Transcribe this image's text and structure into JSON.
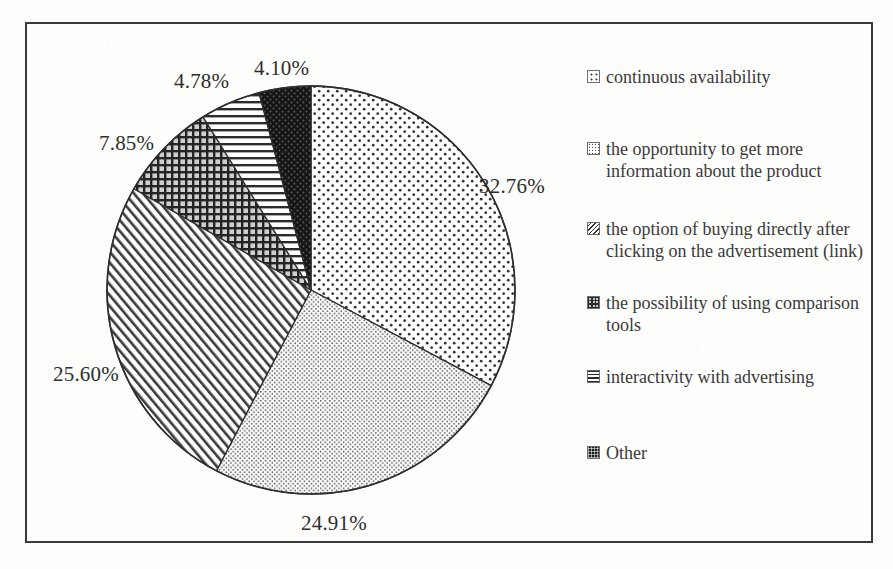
{
  "chart_data": {
    "type": "pie",
    "title": "",
    "xlabel": "",
    "ylabel": "",
    "legend_position": "right",
    "grid": false,
    "start_angle_deg": 0,
    "direction": "clockwise",
    "categories": [
      "continuous availability",
      "the opportunity to get more information about the product",
      "the option of buying directly after clicking on the advertisement (link)",
      "the possibility of using comparison tools",
      "interactivity with advertising",
      "Other"
    ],
    "values": [
      32.76,
      24.91,
      25.6,
      7.85,
      4.78,
      4.1
    ],
    "data_labels": [
      "32.76%",
      "24.91%",
      "25.60%",
      "7.85%",
      "4.78%",
      "4.10%"
    ],
    "slice_patterns": [
      "dots-sparse",
      "dots-dense",
      "diagonal-hatch",
      "checkered",
      "horizontal-lines",
      "solid-black"
    ]
  },
  "legend": {
    "items": [
      {
        "label": "continuous availability",
        "pattern": "dots-sparse"
      },
      {
        "label": "the opportunity to get more information about the product",
        "pattern": "dots-dense"
      },
      {
        "label": "the option of buying directly after clicking on the advertisement (link)",
        "pattern": "diagonal-hatch"
      },
      {
        "label": "the possibility of using comparison tools",
        "pattern": "checkered"
      },
      {
        "label": "interactivity with advertising",
        "pattern": "horizontal-lines"
      },
      {
        "label": "Other",
        "pattern": "solid-black"
      }
    ]
  },
  "colors": {
    "frame": "#3b3b3b",
    "ink": "#2e2e2e",
    "page": "#fdfdfc"
  }
}
